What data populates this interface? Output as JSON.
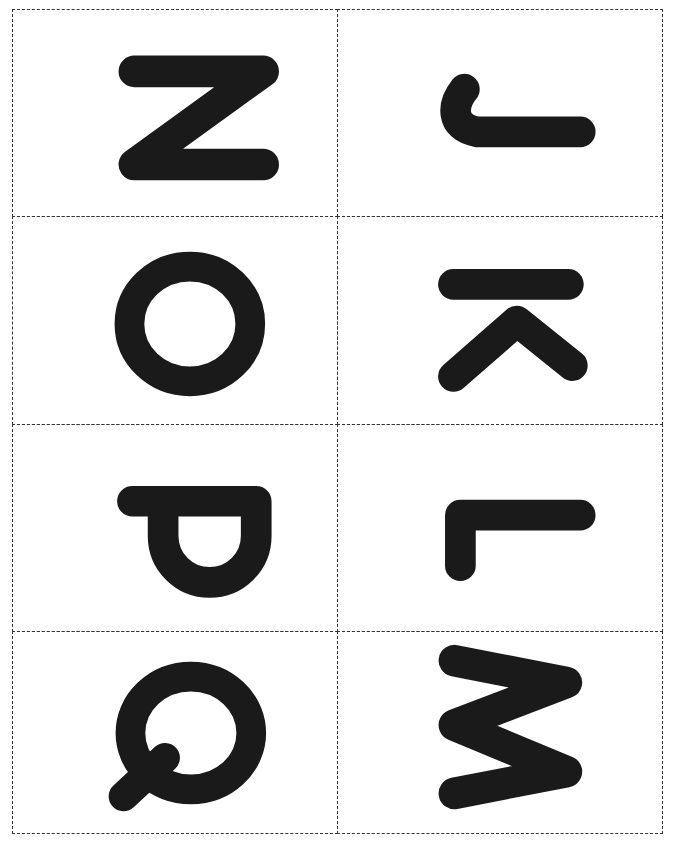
{
  "page": {
    "cards": [
      {
        "letter": "Z",
        "orientation": "upright"
      },
      {
        "letter": "J",
        "orientation": "rotated-90-ccw"
      },
      {
        "letter": "O",
        "orientation": "upright"
      },
      {
        "letter": "K",
        "orientation": "rotated-90-ccw"
      },
      {
        "letter": "P",
        "orientation": "rotated-180"
      },
      {
        "letter": "L",
        "orientation": "rotated-180"
      },
      {
        "letter": "Q",
        "orientation": "rotated-180"
      },
      {
        "letter": "M",
        "orientation": "rotated-90-cw"
      }
    ],
    "ink_color": "#1a1a1a",
    "border_color": "#333333"
  }
}
